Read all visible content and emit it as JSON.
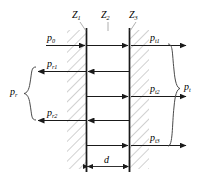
{
  "figure": {
    "name": "acoustic-multilayer-reflection-transmission-diagram",
    "colors": {
      "line": "#1a1a1a",
      "hatch": "#9a9a9a",
      "background": "#ffffff",
      "brace": "#4a4a4a"
    }
  },
  "impedance_labels": [
    {
      "id": "z1",
      "base": "Z",
      "sub": "1"
    },
    {
      "id": "z2",
      "base": "Z",
      "sub": "2"
    },
    {
      "id": "z3",
      "base": "Z",
      "sub": "3"
    }
  ],
  "waves": [
    {
      "id": "p0",
      "base": "p",
      "sub": "0",
      "direction": "right",
      "side": "left",
      "row": 1
    },
    {
      "id": "pt1",
      "base": "p",
      "sub": "t1",
      "direction": "right",
      "side": "right",
      "row": 1
    },
    {
      "id": "pr1",
      "base": "p",
      "sub": "r1",
      "direction": "left",
      "side": "left",
      "row": 2
    },
    {
      "id": "pt2",
      "base": "p",
      "sub": "t2",
      "direction": "right",
      "side": "right",
      "row": 3
    },
    {
      "id": "pr2",
      "base": "p",
      "sub": "r2",
      "direction": "left",
      "side": "left",
      "row": 4
    },
    {
      "id": "pt3",
      "base": "p",
      "sub": "t3",
      "direction": "right",
      "side": "right",
      "row": 5
    }
  ],
  "groups": [
    {
      "id": "pr",
      "base": "p",
      "sub": "r",
      "side": "left",
      "brace": "left-brace"
    },
    {
      "id": "pt",
      "base": "p",
      "sub": "t",
      "side": "right",
      "brace": "right-brace"
    }
  ],
  "dimension": {
    "id": "d",
    "base": "d",
    "sub": "",
    "description": "slab thickness"
  }
}
